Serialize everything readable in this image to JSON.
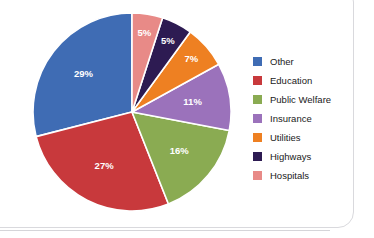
{
  "chart_data": {
    "type": "pie",
    "title": "",
    "subtitle": "",
    "xlabel": "",
    "ylabel": "",
    "grid": false,
    "legend_position": "right",
    "start_angle_deg": 90,
    "direction": "counterclockwise",
    "value_unit": "%",
    "categories": [
      "Other",
      "Education",
      "Public Welfare",
      "Insurance",
      "Utilities",
      "Highways",
      "Hospitals"
    ],
    "values": [
      29,
      27,
      16,
      11,
      7,
      5,
      5
    ],
    "data_labels": [
      "29%",
      "27%",
      "16%",
      "11%",
      "7%",
      "5%",
      "5%"
    ],
    "colors": [
      "#3f6cb4",
      "#c8393c",
      "#8aab52",
      "#9b72bb",
      "#ee8022",
      "#2d1b52",
      "#e88a87"
    ],
    "slices": [
      {
        "label": "Other",
        "value": 29,
        "data_label": "29%",
        "color": "#3f6cb4"
      },
      {
        "label": "Education",
        "value": 27,
        "data_label": "27%",
        "color": "#c8393c"
      },
      {
        "label": "Public Welfare",
        "value": 16,
        "data_label": "16%",
        "color": "#8aab52"
      },
      {
        "label": "Insurance",
        "value": 11,
        "data_label": "11%",
        "color": "#9b72bb"
      },
      {
        "label": "Utilities",
        "value": 7,
        "data_label": "7%",
        "color": "#ee8022"
      },
      {
        "label": "Highways",
        "value": 5,
        "data_label": "5%",
        "color": "#2d1b52"
      },
      {
        "label": "Hospitals",
        "value": 5,
        "data_label": "5%",
        "color": "#e88a87"
      }
    ]
  },
  "legend": {
    "items": [
      {
        "label": "Other",
        "color": "#3f6cb4"
      },
      {
        "label": "Education",
        "color": "#c8393c"
      },
      {
        "label": "Public Welfare",
        "color": "#8aab52"
      },
      {
        "label": "Insurance",
        "color": "#9b72bb"
      },
      {
        "label": "Utilities",
        "color": "#ee8022"
      },
      {
        "label": "Highways",
        "color": "#2d1b52"
      },
      {
        "label": "Hospitals",
        "color": "#e88a87"
      }
    ]
  }
}
